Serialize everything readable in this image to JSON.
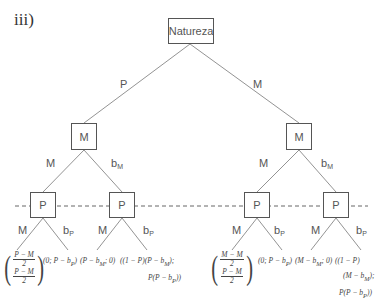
{
  "figure_label": "iii)",
  "nodes": {
    "root": "Natureza",
    "left_m": "M",
    "right_m": "M",
    "p1": "P",
    "p2": "P",
    "p3": "P",
    "p4": "P"
  },
  "edges": {
    "root_left": "P",
    "root_right": "M",
    "lm_left": "M",
    "lm_right_base": "b",
    "lm_right_sub": "M",
    "rm_left": "M",
    "rm_right_base": "b",
    "rm_right_sub": "M",
    "p1_left": "M",
    "p1_right_base": "b",
    "p1_right_sub": "P",
    "p2_left": "M",
    "p2_right_base": "b",
    "p2_right_sub": "P",
    "p3_left": "M",
    "p3_right_base": "b",
    "p3_right_sub": "P",
    "p4_left": "M",
    "p4_right_base": "b",
    "p4_right_sub": "P"
  },
  "payoffs": {
    "t1_top_num": "P − M",
    "t1_top_den": "2",
    "t1_bot_num": "P − M",
    "t1_bot_den": "2",
    "t2": "(0; P − b",
    "t2_sub": "P",
    "t2_end": ")",
    "t3": "(P − b",
    "t3_sub": "M",
    "t3_end": "; 0)",
    "t4_line1": "((1 − P)(P − b",
    "t4_line1_sub": "M",
    "t4_line1_end": ");",
    "t4_line2": "P(P − b",
    "t4_line2_sub": "P",
    "t4_line2_end": "))",
    "t5_top_num": "M − M",
    "t5_top_den": "2",
    "t5_bot_num": "P − M",
    "t5_bot_den": "2",
    "t6": "(0; P − b",
    "t6_sub": "P",
    "t6_end": ")",
    "t7": "(M − b",
    "t7_sub": "M",
    "t7_end": "; 0)",
    "t8_line1": "((1 − P)",
    "t8_line2": "(M − b",
    "t8_line2_sub": "M",
    "t8_line2_end": ");",
    "t8_line3": "P(P − b",
    "t8_line3_sub": "P",
    "t8_line3_end": "))"
  }
}
